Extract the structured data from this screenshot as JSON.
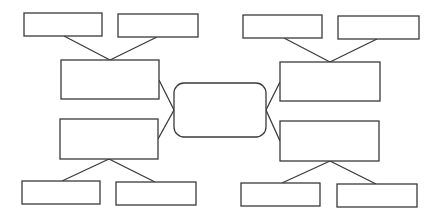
{
  "diagram": {
    "type": "mind-map",
    "colors": {
      "stroke": "#3a3a3a",
      "fill": "#ffffff",
      "background": "#ffffff"
    },
    "center": {
      "label": "",
      "shape": "rounded-rectangle"
    },
    "branches": [
      {
        "position": "left-upper",
        "label": "",
        "children": [
          {
            "label": ""
          },
          {
            "label": ""
          }
        ]
      },
      {
        "position": "left-lower",
        "label": "",
        "children": [
          {
            "label": ""
          },
          {
            "label": ""
          }
        ]
      },
      {
        "position": "right-upper",
        "label": "",
        "children": [
          {
            "label": ""
          },
          {
            "label": ""
          }
        ]
      },
      {
        "position": "right-lower",
        "label": "",
        "children": [
          {
            "label": ""
          },
          {
            "label": ""
          }
        ]
      }
    ]
  }
}
